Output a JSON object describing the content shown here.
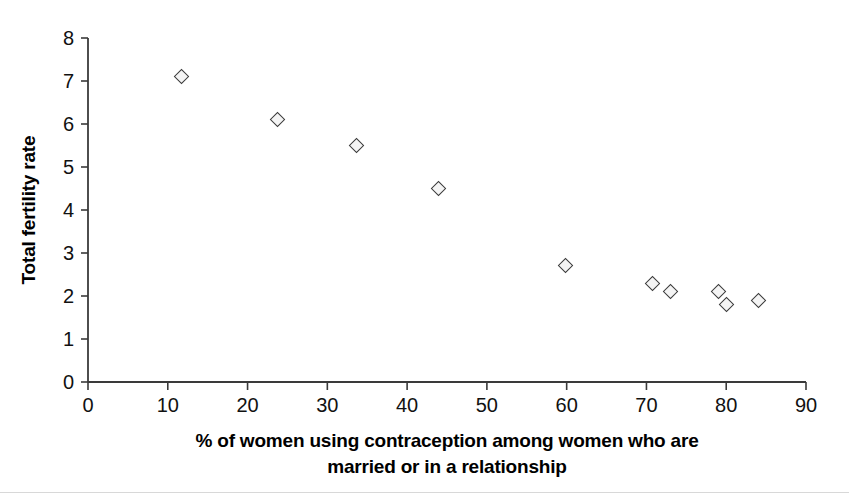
{
  "chart_data": {
    "type": "scatter",
    "title": "",
    "xlabel": "% of women using contraception among women who are married or in a relationship",
    "xlabel_line1": "% of women using contraception among women who are",
    "xlabel_line2": "married or in a relationship",
    "ylabel": "Total fertility rate",
    "xlim": [
      0,
      90
    ],
    "ylim": [
      0,
      8
    ],
    "xticks": [
      0,
      10,
      20,
      30,
      40,
      50,
      60,
      70,
      80,
      90
    ],
    "yticks": [
      0,
      1,
      2,
      3,
      4,
      5,
      6,
      7,
      8
    ],
    "xtick_labels": [
      "0",
      "10",
      "20",
      "30",
      "40",
      "50",
      "60",
      "70",
      "80",
      "90"
    ],
    "ytick_labels": [
      "0",
      "1",
      "2",
      "3",
      "4",
      "5",
      "6",
      "7",
      "8"
    ],
    "grid": false,
    "legend": null,
    "marker": "open-diamond",
    "marker_color": "#3b3b3b",
    "points": [
      {
        "x": 11.7,
        "y": 7.1
      },
      {
        "x": 23.7,
        "y": 6.1
      },
      {
        "x": 33.7,
        "y": 5.5
      },
      {
        "x": 43.9,
        "y": 4.5
      },
      {
        "x": 59.8,
        "y": 2.7
      },
      {
        "x": 70.8,
        "y": 2.3
      },
      {
        "x": 73.0,
        "y": 2.1
      },
      {
        "x": 79.0,
        "y": 2.1
      },
      {
        "x": 80.0,
        "y": 1.8
      },
      {
        "x": 84.0,
        "y": 1.9
      }
    ],
    "x": [
      11.7,
      23.7,
      33.7,
      43.9,
      59.8,
      70.8,
      73.0,
      79.0,
      80.0,
      84.0
    ],
    "values": [
      7.1,
      6.1,
      5.5,
      4.5,
      2.7,
      2.3,
      2.1,
      2.1,
      1.8,
      1.9
    ]
  },
  "colors": {
    "axis": "#3a3a3a",
    "marker_stroke": "#3b3b3b",
    "marker_fill": "#f4f4f4",
    "text": "#111111",
    "background": "#ffffff",
    "rule": "#d8d8d8"
  }
}
